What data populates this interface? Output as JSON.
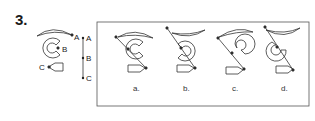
{
  "question": {
    "number": "3."
  },
  "reference": {
    "points": [
      "A",
      "B",
      "C"
    ],
    "scale_labels": [
      "A",
      "B",
      "C"
    ]
  },
  "options": [
    {
      "label": "a."
    },
    {
      "label": "b."
    },
    {
      "label": "c."
    },
    {
      "label": "d."
    }
  ]
}
